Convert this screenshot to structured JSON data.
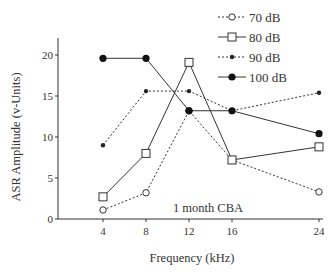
{
  "chart_data": {
    "type": "line",
    "title": "",
    "xlabel": "Frequency (kHz)",
    "ylabel": "ASR Amplitude (v-Units)",
    "x": [
      4,
      8,
      12,
      16,
      24
    ],
    "x_tick_labels": [
      "4",
      "8",
      "12",
      "16",
      "24"
    ],
    "y_ticks": [
      0,
      5,
      10,
      15,
      20
    ],
    "y_tick_labels": [
      "0",
      "5",
      "10",
      "15",
      "20"
    ],
    "ylim": [
      0,
      22
    ],
    "x_scale": "categorical-spaced (4,8,12,16 evenly spaced; 24 at double gap)",
    "grid": false,
    "legend_position": "top-right",
    "annotation": "1 month CBA",
    "series": [
      {
        "name": "70 dB",
        "marker": "open-circle",
        "line": "dashed",
        "values": [
          1.1,
          3.2,
          13.2,
          7.2,
          3.3
        ]
      },
      {
        "name": "80 dB",
        "marker": "open-square",
        "line": "solid",
        "values": [
          2.7,
          8.0,
          19.1,
          7.2,
          8.8
        ]
      },
      {
        "name": "90 dB",
        "marker": "small-filled-diamond",
        "line": "dashed",
        "values": [
          9.0,
          15.6,
          15.6,
          13.2,
          15.4
        ]
      },
      {
        "name": "100 dB",
        "marker": "filled-circle",
        "line": "solid",
        "values": [
          19.6,
          19.6,
          13.2,
          13.2,
          10.4
        ]
      }
    ]
  }
}
